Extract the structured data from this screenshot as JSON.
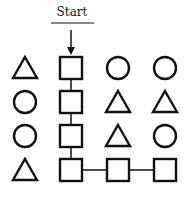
{
  "start_label": "Start",
  "grid": [
    [
      "triangle",
      "square",
      "circle",
      "circle"
    ],
    [
      "circle",
      "square",
      "triangle",
      "triangle"
    ],
    [
      "circle",
      "square",
      "triangle",
      "circle"
    ],
    [
      "triangle",
      "square",
      "square",
      "square"
    ]
  ],
  "path": [
    [
      0,
      1
    ],
    [
      1,
      1
    ],
    [
      2,
      1
    ],
    [
      3,
      1
    ],
    [
      3,
      2
    ],
    [
      3,
      3
    ]
  ],
  "colors": {
    "stroke": "#111111",
    "background": "#ffffff"
  }
}
